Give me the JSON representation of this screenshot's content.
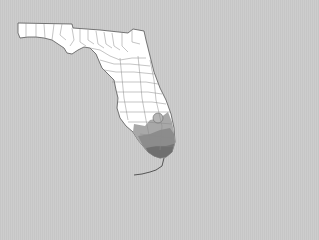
{
  "map": {
    "region": "Florida",
    "subdivision": "counties",
    "colors": {
      "background": "#c9c9c9",
      "land": "#ffffff",
      "county_border": "#8a8a8a",
      "coast": "#555555",
      "range_light": "#a8a8a8",
      "range_mid": "#8c8c8c",
      "range_dark": "#6f6f6f"
    },
    "shaded_area": "southern peninsula (range distribution)"
  }
}
